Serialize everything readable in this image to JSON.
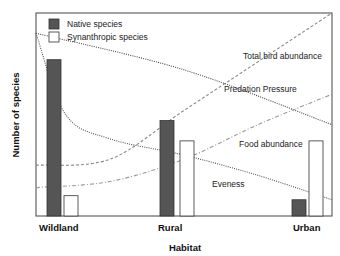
{
  "chart_data": {
    "type": "bar",
    "title": "",
    "xlabel": "Habitat",
    "ylabel": "Number of species",
    "categories": [
      "Wildland",
      "Rural",
      "Urban"
    ],
    "ylim": [
      0,
      100
    ],
    "grid": false,
    "legend_position": "top-left",
    "series": [
      {
        "name": "Native species",
        "color": "#555555",
        "values": [
          77,
          47,
          8
        ]
      },
      {
        "name": "Synanthropic species",
        "color": "#ffffff",
        "values": [
          10,
          37,
          37
        ]
      }
    ],
    "trend_lines": [
      {
        "name": "Total bird abundance",
        "style": "dashed",
        "color": "#888888",
        "x": [
          0,
          0.25,
          0.5,
          0.75,
          1.0
        ],
        "y": [
          25,
          28,
          52,
          76,
          100
        ]
      },
      {
        "name": "Predation Pressure",
        "style": "dotted",
        "color": "#444444",
        "x": [
          0,
          0.5,
          1.0
        ],
        "y": [
          90,
          72,
          45
        ]
      },
      {
        "name": "Food abundance",
        "style": "dash-dot",
        "color": "#999999",
        "x": [
          0,
          0.25,
          0.5,
          0.75,
          1.0
        ],
        "y": [
          14,
          17,
          28,
          45,
          60
        ]
      },
      {
        "name": "Eveness",
        "style": "dotted",
        "color": "#555555",
        "x": [
          0,
          0.1,
          0.25,
          0.5,
          0.75,
          1.0
        ],
        "y": [
          90,
          50,
          38,
          30,
          20,
          8
        ]
      }
    ],
    "annotations": [
      "Total bird abundance",
      "Predation Pressure",
      "Food abundance",
      "Eveness"
    ]
  }
}
